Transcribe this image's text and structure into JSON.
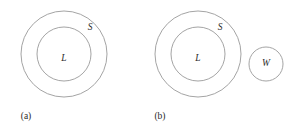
{
  "figure": {
    "background_color": "#ffffff",
    "stroke_color": "#9a9a9a",
    "text_color": "#2a2a2a",
    "panels": [
      {
        "caption": "(a)",
        "caption_x": 26,
        "caption_y": 117,
        "circles": [
          {
            "label": "S",
            "cx": 64,
            "cy": 54,
            "r": 43,
            "label_x": 90,
            "label_y": 28
          },
          {
            "label": "L",
            "cx": 64,
            "cy": 54,
            "r": 27,
            "label_x": 64,
            "label_y": 59
          }
        ]
      },
      {
        "caption": "(b)",
        "caption_x": 160,
        "caption_y": 117,
        "circles": [
          {
            "label": "S",
            "cx": 198,
            "cy": 54,
            "r": 43,
            "label_x": 220,
            "label_y": 28
          },
          {
            "label": "L",
            "cx": 198,
            "cy": 54,
            "r": 27,
            "label_x": 198,
            "label_y": 59
          },
          {
            "label": "W",
            "cx": 266,
            "cy": 64,
            "r": 17,
            "label_x": 266,
            "label_y": 64
          }
        ]
      }
    ]
  }
}
